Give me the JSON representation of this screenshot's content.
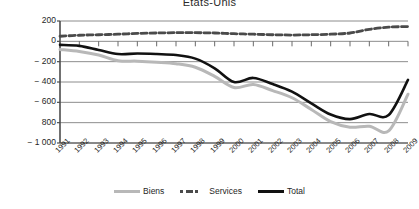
{
  "chart_data": {
    "type": "line",
    "title": "États-Unis",
    "xlabel": "",
    "ylabel": "",
    "ylim": [
      -1000,
      200
    ],
    "yticks": [
      200,
      0,
      -200,
      -400,
      -600,
      -800,
      -1000
    ],
    "ytick_labels": [
      "200",
      "0",
      "− 200",
      "− 400",
      "− 600",
      "800",
      "− 1 000"
    ],
    "grid": true,
    "legend_position": "bottom",
    "x": [
      1991,
      1992,
      1993,
      1994,
      1995,
      1996,
      1997,
      1998,
      1999,
      2000,
      2001,
      2002,
      2003,
      2004,
      2005,
      2006,
      2007,
      2008,
      2009
    ],
    "xtick_labels": [
      "1991",
      "1992",
      "1993",
      "1994",
      "1995",
      "1996",
      "1997",
      "1998",
      "1999",
      "2000",
      "2001",
      "2002",
      "2003",
      "2004",
      "2005",
      "2006",
      "2007",
      "2008",
      "2009"
    ],
    "series": [
      {
        "name": "Biens",
        "style": "solid",
        "color": "#b8b8b8",
        "values": [
          -80,
          -100,
          -135,
          -190,
          -195,
          -205,
          -220,
          -255,
          -345,
          -455,
          -425,
          -485,
          -555,
          -670,
          -790,
          -845,
          -835,
          -880,
          -520
        ]
      },
      {
        "name": "Services",
        "style": "dashed",
        "color": "#4a4a4a",
        "values": [
          50,
          60,
          65,
          70,
          78,
          82,
          85,
          85,
          82,
          75,
          70,
          65,
          62,
          65,
          70,
          82,
          118,
          140,
          145
        ]
      },
      {
        "name": "Total",
        "style": "solid",
        "color": "#111111",
        "values": [
          -35,
          -45,
          -85,
          -125,
          -120,
          -125,
          -135,
          -170,
          -265,
          -400,
          -360,
          -420,
          -495,
          -610,
          -720,
          -765,
          -715,
          -725,
          -380
        ]
      }
    ]
  },
  "legend": {
    "items": [
      {
        "label": "Biens",
        "marker": "solid-line-gray"
      },
      {
        "label": "Services",
        "marker": "dashed-line-dark"
      },
      {
        "label": "Total",
        "marker": "solid-line-black"
      }
    ]
  },
  "axes": {
    "plot_left_px": 60,
    "plot_right_px": 408,
    "plot_top_px": 21,
    "plot_bottom_px": 143
  }
}
